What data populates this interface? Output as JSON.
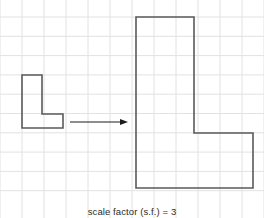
{
  "figure": {
    "caption": "scale factor (s.f.) = 3",
    "background_color": "#ffffff",
    "stroke_color": "#5a5a5a",
    "grid_color": "#e2e2e2",
    "grid": {
      "visible": true,
      "cell_width": 22,
      "cell_height": 19.3,
      "columns": 12,
      "rows": 11,
      "x_lines": [
        0,
        22,
        44,
        66,
        88,
        110,
        132,
        154,
        176,
        198,
        220,
        242,
        264
      ],
      "y_lines": [
        17,
        36.3,
        55.6,
        74.9,
        94.2,
        113.5,
        132.8,
        152.1,
        171.4,
        190.7
      ]
    },
    "shapes": [
      {
        "name": "small-l-shape",
        "label": "original L shape",
        "stroke": "#5a5a5a",
        "stroke_width": 1.6,
        "fill": "none",
        "points": [
          [
            22,
            75
          ],
          [
            42,
            75
          ],
          [
            42,
            114
          ],
          [
            63,
            114
          ],
          [
            63,
            128
          ],
          [
            22,
            128
          ]
        ],
        "grid_units": {
          "width": 2,
          "height": 3,
          "arm_width": 1,
          "arm_height": 1
        }
      },
      {
        "name": "large-l-shape",
        "label": "enlarged L shape",
        "stroke": "#5a5a5a",
        "stroke_width": 1.6,
        "fill": "none",
        "points": [
          [
            136,
            17
          ],
          [
            194,
            17
          ],
          [
            194,
            133
          ],
          [
            253,
            133
          ],
          [
            253,
            188
          ],
          [
            136,
            188
          ]
        ],
        "grid_units": {
          "width": 6,
          "height": 9,
          "arm_width": 3,
          "arm_height": 3
        }
      }
    ],
    "arrow": {
      "name": "enlargement-arrow",
      "label": "maps to",
      "stroke": "#1c1c1c",
      "stroke_width": 1,
      "from": [
        70,
        122
      ],
      "to": [
        128,
        122
      ],
      "head_length": 8,
      "head_width": 6
    }
  }
}
